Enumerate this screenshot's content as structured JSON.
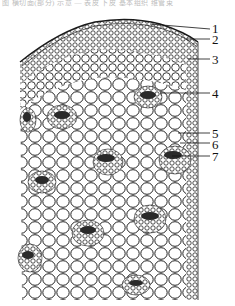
{
  "caption": {
    "text": "图 横切面(部分) 示意 — 表皮 下皮 基本组织 维管束",
    "visible": "partially cut off at top"
  },
  "figure": {
    "colors": {
      "ink": "#1a1a1a",
      "cell_fill": "#ffffff",
      "bundle_dark": "#2a2a2a",
      "background": "#ffffff"
    }
  },
  "labels": [
    {
      "num": "1",
      "y": 29
    },
    {
      "num": "2",
      "y": 39
    },
    {
      "num": "3",
      "y": 59
    },
    {
      "num": "4",
      "y": 93
    },
    {
      "num": "5",
      "y": 133
    },
    {
      "num": "6",
      "y": 143
    },
    {
      "num": "7",
      "y": 156
    }
  ]
}
